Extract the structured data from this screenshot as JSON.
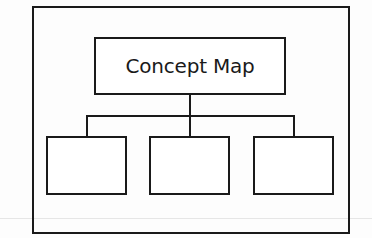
{
  "diagram": {
    "type": "concept-map",
    "root": {
      "label": "Concept Map"
    },
    "children": [
      {
        "label": ""
      },
      {
        "label": ""
      },
      {
        "label": ""
      }
    ],
    "colors": {
      "stroke": "#1a1a1a",
      "background": "#ffffff"
    }
  }
}
